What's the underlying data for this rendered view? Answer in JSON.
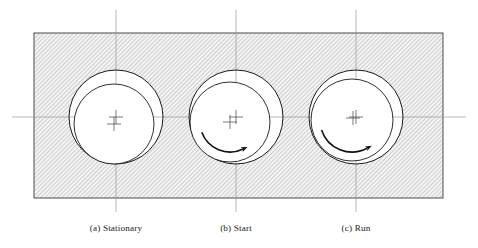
{
  "figure": {
    "background_color": "#ffffff",
    "line_color": "#1a1a1a",
    "centerline_color": "#9a9a9a",
    "hatch_color": "#8c8c8c",
    "housing": {
      "name": "bearing housing block",
      "x": 34,
      "y": 33,
      "width": 409,
      "height": 165,
      "fill": "#f2f2f2",
      "hatch_angle_deg": 45,
      "hatch_spacing": 3
    },
    "axes": {
      "horizontal": {
        "y": 117,
        "x1": 12,
        "x2": 466
      },
      "vertical_x": [
        116,
        236,
        356
      ],
      "vertical_y1": 10,
      "vertical_y2": 212
    },
    "panels": [
      {
        "id": "a",
        "label": "(a) Stationary",
        "caption_x": 116,
        "caption_y": 231,
        "bore": {
          "cx": 116,
          "cy": 117,
          "r": 47
        },
        "journal": {
          "cx": 114,
          "cy": 124,
          "r": 40
        },
        "bore_center_mark": {
          "cx": 116,
          "cy": 117
        },
        "journal_center_mark": {
          "cx": 114,
          "cy": 124
        },
        "rotation_arrow": null,
        "description": "journal at rest on bottom of bore, maximum eccentricity downward"
      },
      {
        "id": "b",
        "label": "(b) Start",
        "caption_x": 236,
        "caption_y": 231,
        "bore": {
          "cx": 236,
          "cy": 117,
          "r": 47
        },
        "journal": {
          "cx": 230,
          "cy": 122,
          "r": 40
        },
        "bore_center_mark": {
          "cx": 236,
          "cy": 117
        },
        "journal_center_mark": {
          "cx": 230,
          "cy": 122
        },
        "rotation_arrow": {
          "name": "clockwise-rotation-arrow",
          "cx": 230,
          "cy": 122,
          "r": 30,
          "start_deg": 160,
          "end_deg": 65,
          "direction": "clockwise"
        },
        "description": "journal climbs the bore wall at start-up, rotation clockwise"
      },
      {
        "id": "c",
        "label": "(c) Run",
        "caption_x": 356,
        "caption_y": 231,
        "bore": {
          "cx": 356,
          "cy": 117,
          "r": 47
        },
        "journal": {
          "cx": 352,
          "cy": 120,
          "r": 41
        },
        "bore_center_mark": {
          "cx": 356,
          "cy": 117
        },
        "journal_center_mark": {
          "cx": 353,
          "cy": 118
        },
        "rotation_arrow": {
          "name": "clockwise-rotation-arrow",
          "cx": 352,
          "cy": 120,
          "r": 32,
          "start_deg": 162,
          "end_deg": 62,
          "direction": "clockwise"
        },
        "description": "journal running nearly concentric on hydrodynamic film, rotation clockwise"
      }
    ]
  }
}
